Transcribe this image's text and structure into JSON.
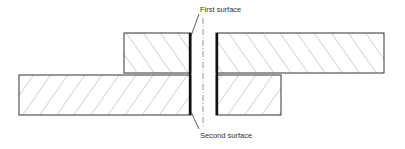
{
  "diagram": {
    "type": "cross-section of two stacked layers cut at a joint",
    "labels": {
      "first_surface": "First surface",
      "second_surface": "Second surface"
    },
    "parts": [
      {
        "id": "upper-left-block",
        "layer": "upper",
        "side": "left",
        "hatch": "forward-diagonal"
      },
      {
        "id": "upper-right-block",
        "layer": "upper",
        "side": "right",
        "hatch": "forward-diagonal"
      },
      {
        "id": "lower-left-block",
        "layer": "lower",
        "side": "left",
        "hatch": "back-diagonal"
      },
      {
        "id": "lower-right-block",
        "layer": "lower",
        "side": "right",
        "hatch": "back-diagonal"
      }
    ],
    "centerline": "dash-dot",
    "colors": {
      "outline": "#333333",
      "hatch": "#8a8a8a",
      "surface_edge": "#111111",
      "background": "#ffffff"
    }
  }
}
